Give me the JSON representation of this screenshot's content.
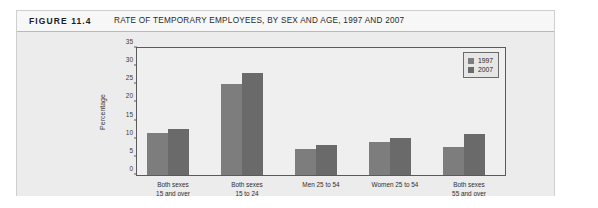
{
  "figure": {
    "label": "FIGURE 11.4",
    "title": "RATE OF TEMPORARY EMPLOYEES, BY SEX AND AGE, 1997 AND 2007"
  },
  "chart_data": {
    "type": "bar",
    "title": "RATE OF TEMPORARY EMPLOYEES, BY SEX AND AGE, 1997 AND 2007",
    "xlabel": "",
    "ylabel": "Percentage",
    "ylim": [
      0,
      35
    ],
    "yticks": [
      0,
      5,
      10,
      15,
      20,
      25,
      30,
      35
    ],
    "grid": false,
    "legend_position": "top-right",
    "categories": [
      "Both sexes 15 and over",
      "Both sexes 15 to 24",
      "Men 25 to 54",
      "Women 25 to 54",
      "Both sexes 55 and over"
    ],
    "category_lines": [
      [
        "Both sexes",
        "15 and over"
      ],
      [
        "Both sexes",
        "15 to 24"
      ],
      [
        "Men 25 to 54",
        ""
      ],
      [
        "Women 25 to 54",
        ""
      ],
      [
        "Both sexes",
        "55 and over"
      ]
    ],
    "series": [
      {
        "name": "1997",
        "color": "#7d7d7d",
        "values": [
          11.6,
          25.2,
          7.3,
          9.2,
          7.6
        ]
      },
      {
        "name": "2007",
        "color": "#6a6a6a",
        "values": [
          12.7,
          28.2,
          8.3,
          10.3,
          11.2
        ]
      }
    ]
  },
  "legend": {
    "items": [
      {
        "label": "1997"
      },
      {
        "label": "2007"
      }
    ]
  }
}
